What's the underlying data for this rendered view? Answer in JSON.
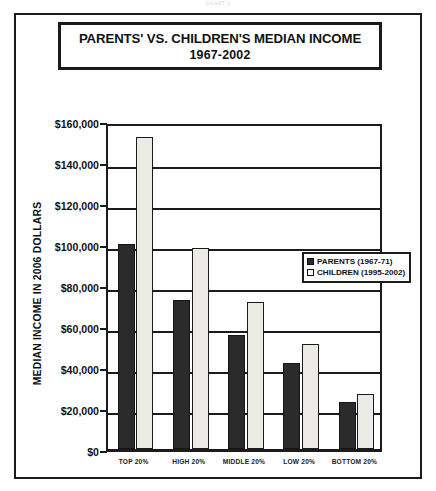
{
  "top_caption": "CHART 1",
  "title": {
    "line1": "PARENTS' VS. CHILDREN'S MEDIAN INCOME",
    "line2": "1967-2002"
  },
  "axis": {
    "y_title": "MEDIAN INCOME IN 2006 DOLLARS",
    "y_ticks": [
      "$160,000",
      "$140,000",
      "$120,000",
      "$100,000",
      "$80,000",
      "$60,000",
      "$40,000",
      "$20,000",
      "$0"
    ]
  },
  "legend": {
    "position": "inside-right",
    "items": [
      {
        "label": "PARENTS (1967-71)",
        "swatch": "filled-black-square"
      },
      {
        "label": "CHILDREN (1995-2002)",
        "swatch": "open-white-square"
      }
    ]
  },
  "colors": {
    "parents": "#2b2b2b",
    "children": "#eceae7",
    "outline": "#1b1b1b",
    "background": "#ffffff"
  },
  "chart_data": {
    "type": "bar",
    "title": "PARENTS' VS. CHILDREN'S MEDIAN INCOME 1967-2002",
    "xlabel": "",
    "ylabel": "MEDIAN INCOME IN 2006 DOLLARS",
    "ylim": [
      0,
      160000
    ],
    "ytick_step": 20000,
    "grid": true,
    "legend_position": "inside-right",
    "categories": [
      "TOP 20%",
      "HIGH 20%",
      "MIDDLE 20%",
      "LOW 20%",
      "BOTTOM 20%"
    ],
    "series": [
      {
        "name": "PARENTS (1967-71)",
        "values": [
          100000,
          72500,
          55500,
          42000,
          23000
        ]
      },
      {
        "name": "CHILDREN (1995-2002)",
        "values": [
          152000,
          98000,
          71500,
          51000,
          27000
        ]
      }
    ]
  }
}
